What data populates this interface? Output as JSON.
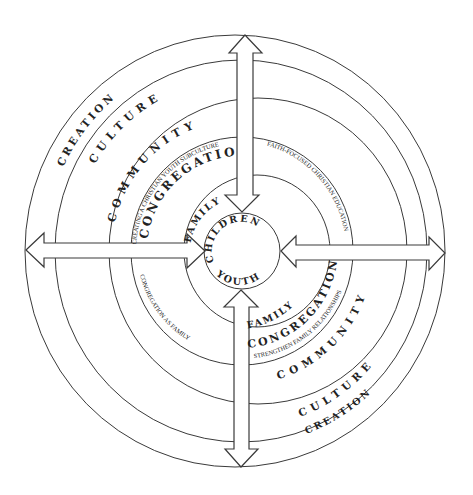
{
  "diagram": {
    "center": {
      "x": 240,
      "y": 251
    },
    "colors": {
      "line": "#3a3a3a",
      "text": "#222222",
      "background": "#ffffff"
    },
    "rings": [
      {
        "name": "creation",
        "rx": 210,
        "ry": 216
      },
      {
        "name": "culture",
        "rx": 186,
        "ry": 191
      },
      {
        "name": "community",
        "rx": 150,
        "ry": 153
      },
      {
        "name": "congregation",
        "rx": 111,
        "ry": 114
      },
      {
        "name": "family",
        "rx": 73,
        "ry": 76
      },
      {
        "name": "children-youth",
        "rx": 38,
        "ry": 38
      }
    ],
    "labels": {
      "upper_left": {
        "creation": "CREATION",
        "culture": "CULTURE",
        "community": "COMMUNITY",
        "congregation_note": "CREATING A CHRISTIAN YOUTH SUBCULTURE",
        "congregation": "CONGREGATION",
        "family": "FAMILY",
        "children": "CHILDREN"
      },
      "upper_right": {
        "congregation_note": "FAITH-FOCUSED CHRISTIAN EDUCATION"
      },
      "lower_left": {
        "congregation_note": "CONGREGATION AS FAMILY"
      },
      "lower_right": {
        "youth": "YOUTH",
        "family": "FAMILY",
        "congregation": "CONGREGATION",
        "congregation_note": "STRENGTHEN FAMILY RELATIONSHIPS",
        "community": "COMMUNITY",
        "culture": "CULTURE",
        "creation": "CREATION"
      }
    },
    "arrows": [
      {
        "name": "arrow-top",
        "direction": "vertical",
        "outer_tip": [
          245,
          35
        ],
        "inner_tip": [
          242,
          212
        ]
      },
      {
        "name": "arrow-bottom",
        "direction": "vertical",
        "outer_tip": [
          241,
          467
        ],
        "inner_tip": [
          241,
          290
        ]
      },
      {
        "name": "arrow-left",
        "direction": "horizontal",
        "outer_tip": [
          26,
          250
        ],
        "inner_tip": [
          205,
          251
        ]
      },
      {
        "name": "arrow-right",
        "direction": "horizontal",
        "outer_tip": [
          445,
          253
        ],
        "inner_tip": [
          281,
          251
        ]
      }
    ]
  }
}
